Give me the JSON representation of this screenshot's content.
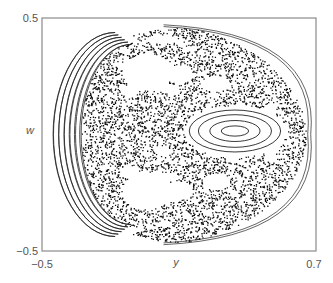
{
  "chart_data": {
    "type": "scatter",
    "title": "",
    "xlabel": "y",
    "ylabel": "w",
    "xlim": [
      -0.5,
      0.7
    ],
    "ylim": [
      -0.5,
      0.5
    ],
    "x_tick_labels": [
      "−0.5",
      "0.7"
    ],
    "x_ticks": [
      -0.5,
      0.7
    ],
    "y_tick_labels": [
      "0.5",
      "−0.5"
    ],
    "y_ticks": [
      0.5,
      -0.5
    ],
    "grid": false,
    "legend": "none",
    "colors": {
      "points": "#111111",
      "frame": "#8a8a8a",
      "curves": "#222222",
      "background": "#ffffff"
    },
    "outer_boundary": {
      "y_min": -0.465,
      "y_max": 0.655,
      "w_min": -0.46,
      "w_max": 0.458,
      "center_y": 0.12,
      "center_w": 0.0
    },
    "islands": [
      {
        "name": "central-island",
        "center": [
          0.345,
          0.015
        ],
        "ring_radii": [
          [
            0.06,
            0.022
          ],
          [
            0.11,
            0.045
          ],
          [
            0.16,
            0.07
          ],
          [
            0.2,
            0.09
          ]
        ]
      },
      {
        "name": "left-crescent-island",
        "center": [
          -0.355,
          0.0
        ],
        "rings": 6
      }
    ],
    "gaps": [
      {
        "name": "upper-gap-1",
        "center": [
          -0.04,
          0.27
        ],
        "size": [
          0.11,
          0.08
        ]
      },
      {
        "name": "upper-gap-2",
        "center": [
          0.1,
          0.26
        ],
        "size": [
          0.06,
          0.04
        ]
      },
      {
        "name": "upper-gap-3",
        "center": [
          -0.12,
          0.19
        ],
        "size": [
          0.04,
          0.025
        ]
      },
      {
        "name": "upper-gap-4",
        "center": [
          0.05,
          0.2
        ],
        "size": [
          0.05,
          0.02
        ]
      },
      {
        "name": "upper-gap-5",
        "center": [
          0.02,
          0.41
        ],
        "size": [
          0.07,
          0.02
        ]
      },
      {
        "name": "lower-gap-1",
        "center": [
          -0.04,
          -0.24
        ],
        "size": [
          0.11,
          0.08
        ]
      },
      {
        "name": "lower-gap-2",
        "center": [
          0.1,
          -0.24
        ],
        "size": [
          0.06,
          0.04
        ]
      },
      {
        "name": "lower-gap-3",
        "center": [
          -0.12,
          -0.16
        ],
        "size": [
          0.04,
          0.025
        ]
      },
      {
        "name": "lower-gap-4",
        "center": [
          0.05,
          -0.18
        ],
        "size": [
          0.05,
          0.02
        ]
      },
      {
        "name": "upper-mid-gap",
        "center": [
          0.26,
          0.22
        ],
        "size": [
          0.06,
          0.035
        ]
      },
      {
        "name": "lower-mid-gap",
        "center": [
          0.26,
          -0.2
        ],
        "size": [
          0.06,
          0.035
        ]
      },
      {
        "name": "right-gap-upper",
        "center": [
          0.5,
          0.1
        ],
        "size": [
          0.025,
          0.04
        ]
      },
      {
        "name": "right-gap-lower",
        "center": [
          0.5,
          -0.08
        ],
        "size": [
          0.025,
          0.04
        ]
      },
      {
        "name": "center-lower-gap",
        "center": [
          0.03,
          -0.07
        ],
        "size": [
          0.03,
          0.02
        ]
      }
    ],
    "point_count": 9000
  },
  "labels": {
    "ylabel": "w",
    "xlabel": "y",
    "ytick_top": "0.5",
    "ytick_bottom": "−0.5",
    "xtick_left": "−0.5",
    "xtick_right": "0.7"
  }
}
